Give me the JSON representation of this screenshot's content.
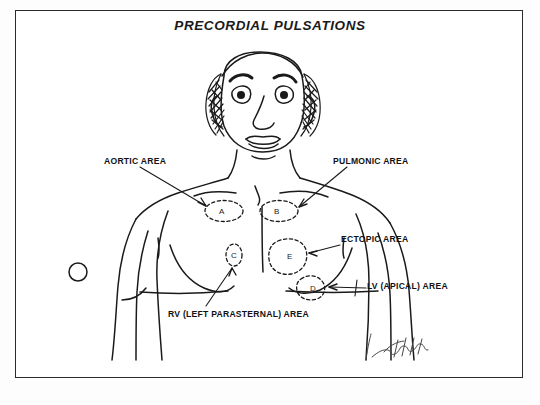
{
  "figure": {
    "title": "PRECORDIAL PULSATIONS",
    "border_color": "#2b2b2b",
    "ink_color": "#1a1a1a",
    "background_color": "#ffffff"
  },
  "labels": [
    {
      "id": "aortic",
      "text": "AORTIC AREA",
      "zone": "A"
    },
    {
      "id": "pulmonic",
      "text": "PULMONIC AREA",
      "zone": "B"
    },
    {
      "id": "ectopic",
      "text": "ECTOPIC AREA",
      "zone": "E"
    },
    {
      "id": "lv",
      "text": "LV (APICAL) AREA",
      "zone": "D"
    },
    {
      "id": "rv",
      "text": "RV (LEFT PARASTERNAL) AREA",
      "zone": "C"
    }
  ],
  "zones": [
    {
      "letter": "A",
      "name": "aortic-area"
    },
    {
      "letter": "B",
      "name": "pulmonic-area"
    },
    {
      "letter": "C",
      "name": "rv-left-parasternal-area"
    },
    {
      "letter": "D",
      "name": "lv-apical-area"
    },
    {
      "letter": "E",
      "name": "ectopic-area"
    }
  ],
  "signature": {
    "present": true,
    "text": ""
  }
}
